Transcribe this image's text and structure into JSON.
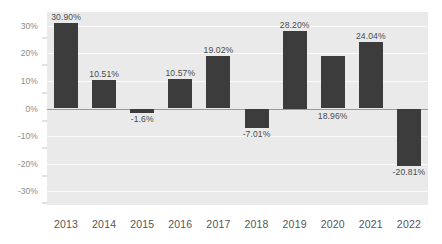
{
  "chart_data": {
    "type": "bar",
    "title": "",
    "subtitle": "",
    "xlabel": "",
    "ylabel": "",
    "categories": [
      "2013",
      "2014",
      "2015",
      "2016",
      "2017",
      "2018",
      "2019",
      "2020",
      "2021",
      "2022"
    ],
    "values": [
      30.9,
      10.51,
      -1.6,
      10.57,
      19.02,
      -7.01,
      28.2,
      18.96,
      24.04,
      -20.81
    ],
    "data_labels": [
      "30.90%",
      "10.51%",
      "-1.6%",
      "10.57%",
      "19.02%",
      "-7.01%",
      "28.20%",
      "18.96%",
      "24.04%",
      "-20.81%"
    ],
    "label_placement": [
      "above",
      "above",
      "below",
      "above",
      "above",
      "below",
      "above",
      "below-zero-line",
      "above",
      "below"
    ],
    "ylim": [
      -35,
      35
    ],
    "y_ticks": [
      30,
      20,
      10,
      0,
      -10,
      -20,
      -30
    ],
    "y_tick_labels": [
      "30%",
      "20%",
      "10%",
      "0%",
      "-10%",
      "-20%",
      "-30%"
    ],
    "grid": true,
    "legend": false,
    "legend_position": "none",
    "units": "percent",
    "colors": {
      "bar": "#3c3c3c",
      "plot_background": "#eaeaea",
      "gridline": "#fafafa",
      "zero_line": "#9a9a9a",
      "axis_text": "#555555",
      "y_axis_text": "#8c8c8c",
      "data_label_text": "#4a4a4a",
      "page_background": "#ffffff"
    }
  }
}
